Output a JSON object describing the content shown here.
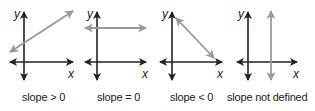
{
  "colors": {
    "axis": "#222222",
    "line": "#999999"
  },
  "panels": [
    {
      "case": "positive-slope",
      "x_axis_label": "x",
      "y_axis_label": "y",
      "caption": "slope > 0"
    },
    {
      "case": "zero-slope",
      "x_axis_label": "x",
      "y_axis_label": "y",
      "caption": "slope = 0"
    },
    {
      "case": "negative-slope",
      "x_axis_label": "x",
      "y_axis_label": "y",
      "caption": "slope < 0"
    },
    {
      "case": "undefined-slope",
      "x_axis_label": "x",
      "y_axis_label": "y",
      "caption": "slope not defined"
    }
  ]
}
